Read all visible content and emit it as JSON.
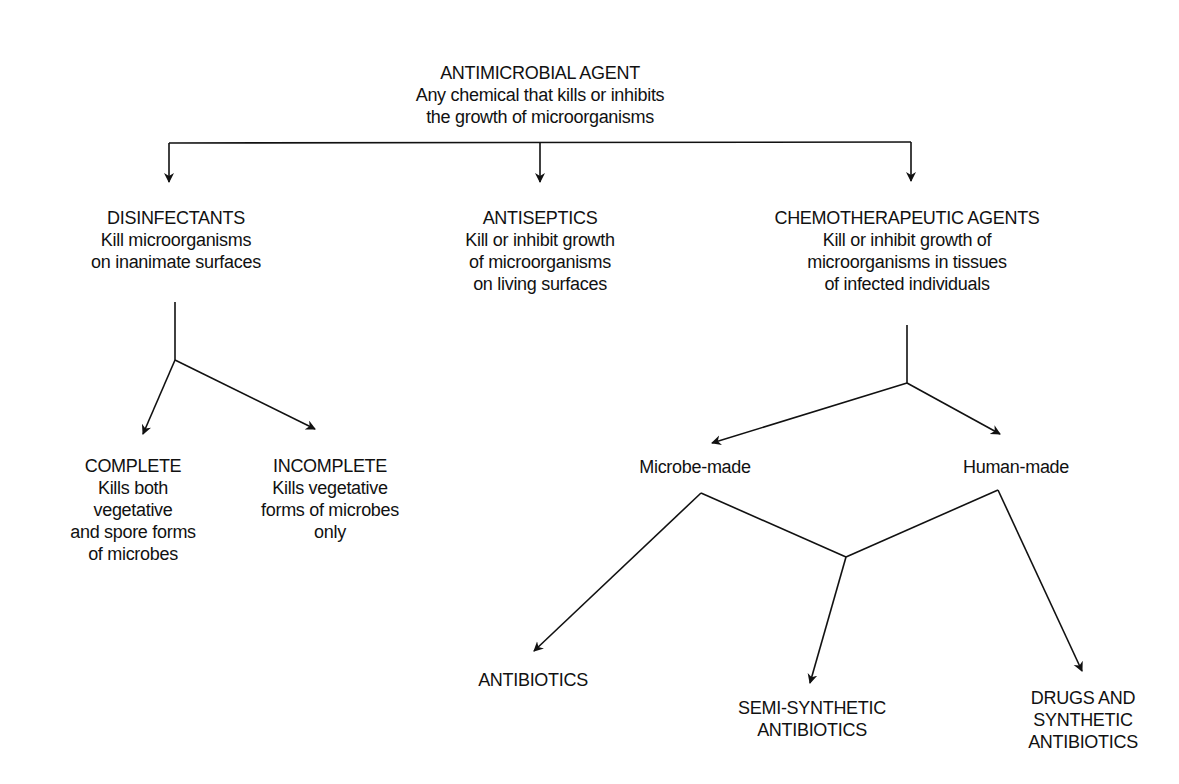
{
  "diagram": {
    "root": {
      "title": "ANTIMICROBIAL AGENT",
      "desc_lines": [
        "Any chemical that kills or inhibits",
        "the growth of microorganisms"
      ]
    },
    "level1": [
      {
        "title": "DISINFECTANTS",
        "desc_lines": [
          "Kill microorganisms",
          "on inanimate surfaces"
        ]
      },
      {
        "title": "ANTISEPTICS",
        "desc_lines": [
          "Kill or inhibit growth",
          "of microorganisms",
          "on living surfaces"
        ]
      },
      {
        "title": "CHEMOTHERAPEUTIC AGENTS",
        "desc_lines": [
          "Kill or inhibit growth of",
          "microorganisms in tissues",
          "of infected individuals"
        ]
      }
    ],
    "disinfectant_types": [
      {
        "title": "COMPLETE",
        "desc_lines": [
          "Kills both",
          "vegetative",
          "and spore forms",
          "of microbes"
        ]
      },
      {
        "title": "INCOMPLETE",
        "desc_lines": [
          "Kills vegetative",
          "forms of microbes",
          "only"
        ]
      }
    ],
    "chemo_origins": [
      {
        "title": "Microbe-made"
      },
      {
        "title": "Human-made"
      }
    ],
    "products": [
      {
        "title_lines": [
          "ANTIBIOTICS"
        ]
      },
      {
        "title_lines": [
          "SEMI-SYNTHETIC",
          "ANTIBIOTICS"
        ]
      },
      {
        "title_lines": [
          "DRUGS AND",
          "SYNTHETIC",
          "ANTIBIOTICS"
        ]
      }
    ],
    "line_color": "#111111"
  }
}
